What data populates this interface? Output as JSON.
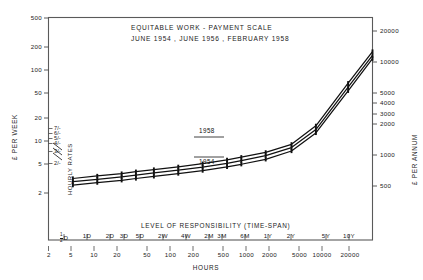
{
  "chart_data": {
    "type": "line",
    "title": "EQUITABLE WORK - PAYMENT SCALE",
    "subtitle": "JUNE 1954 , JUNE 1956 , FEBRUARY 1958",
    "xlabel": "HOURS",
    "xlabel_secondary": "LEVEL OF RESPONSIBILITY (TIME-SPAN)",
    "ylabel": "£ PER WEEK",
    "ylabel_right": "£ PER ANNUM",
    "ylabel_inner": "HOURLY RATES",
    "scale": "log-log",
    "grid": false,
    "legend_position": "inline-annotation",
    "xlim": [
      2,
      20000
    ],
    "ylim": [
      2,
      500
    ],
    "ylim_right": [
      100,
      26000
    ],
    "x_ticks": [
      2,
      5,
      10,
      20,
      50,
      100,
      200,
      500,
      1000,
      2000,
      5000,
      10000,
      20000
    ],
    "x_tick_labels": [
      "2",
      "5",
      "10",
      "20",
      "50",
      "100",
      "200",
      "500",
      "1000",
      "2000",
      "5000",
      "10000",
      "20000"
    ],
    "timespan_tick_labels": [
      "½D",
      "1D",
      "2D",
      "3D",
      "5D",
      "2W",
      "4W",
      "2M",
      "3M",
      "6M",
      "1Y",
      "2Y",
      "5Y",
      "10Y"
    ],
    "timespan_tick_hours": [
      4,
      8,
      16,
      24,
      40,
      80,
      160,
      320,
      480,
      960,
      2000,
      4000,
      10000,
      20000
    ],
    "y_ticks": [
      2,
      5,
      10,
      20,
      50,
      100,
      200,
      500
    ],
    "y_tick_labels": [
      "2",
      "5",
      "10",
      "20",
      "50",
      "100",
      "200",
      "500"
    ],
    "y_right_ticks": [
      500,
      1000,
      2000,
      3000,
      4000,
      5000,
      10000,
      20000
    ],
    "y_right_tick_labels": [
      "500",
      "1000",
      "2000",
      "3000",
      "4000",
      "5000",
      "10000",
      "20000"
    ],
    "hourly_rate_ticks": [
      2,
      3,
      4,
      5,
      6,
      7
    ],
    "hourly_rate_labels": [
      "2/-",
      "3/-",
      "4/-",
      "5/-",
      "6/-",
      "7/-"
    ],
    "annotations": [
      {
        "text": "1958",
        "x_hours": 320,
        "y_pounds": 17.5,
        "position": "above"
      },
      {
        "text": "1954",
        "x_hours": 320,
        "y_pounds": 11.2,
        "position": "below"
      }
    ],
    "series": [
      {
        "name": "1958",
        "x": [
          4,
          8,
          16,
          24,
          40,
          80,
          160,
          320,
          480,
          960,
          2000,
          4000,
          10000,
          20000
        ],
        "y": [
          9.2,
          9.8,
          10.4,
          10.9,
          11.5,
          12.3,
          13.3,
          14.6,
          15.6,
          17.6,
          21.5,
          34.0,
          98.0,
          215.0
        ]
      },
      {
        "name": "1956",
        "x": [
          4,
          8,
          16,
          24,
          40,
          80,
          160,
          320,
          480,
          960,
          2000,
          4000,
          10000,
          20000
        ],
        "y": [
          8.5,
          9.0,
          9.6,
          10.0,
          10.6,
          11.3,
          12.2,
          13.4,
          14.3,
          16.2,
          19.8,
          31.0,
          89.0,
          195.0
        ]
      },
      {
        "name": "1954",
        "x": [
          4,
          8,
          16,
          24,
          40,
          80,
          160,
          320,
          480,
          960,
          2000,
          4000,
          10000,
          20000
        ],
        "y": [
          7.8,
          8.3,
          8.8,
          9.2,
          9.7,
          10.4,
          11.2,
          12.3,
          13.1,
          14.8,
          18.2,
          28.5,
          81.0,
          180.0
        ]
      }
    ]
  },
  "figure": {
    "frame_color": "#5a5a5a",
    "line_color": "#111111",
    "background": "#ffffff"
  }
}
